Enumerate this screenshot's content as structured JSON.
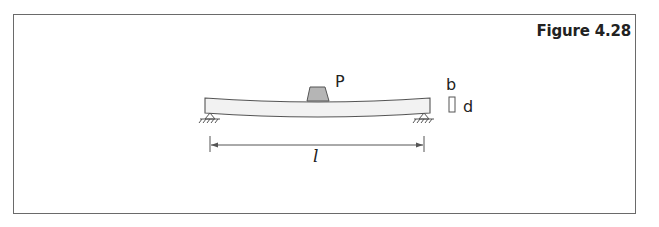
{
  "figure": {
    "title": "Figure 4.28"
  },
  "diagram": {
    "labels": {
      "load": "P",
      "width": "b",
      "depth": "d",
      "span": "l"
    },
    "colors": {
      "beam_fill": "#f2f2f2",
      "load_fill": "#b5b5b5",
      "stroke": "#555555",
      "frame": "#6a6a6a"
    }
  }
}
